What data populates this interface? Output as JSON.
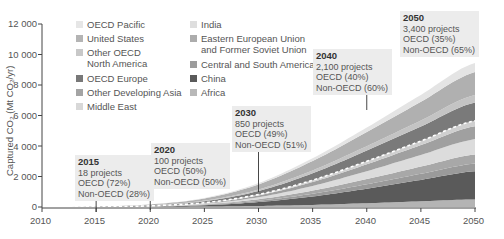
{
  "chart_data": {
    "type": "area",
    "stacked": true,
    "title": "",
    "xlabel": "",
    "ylabel": "Captured CO₂ (Mt CO₂/yr)",
    "xlim": [
      2010,
      2050
    ],
    "ylim": [
      0,
      12000
    ],
    "x_ticks": [
      2010,
      2015,
      2020,
      2025,
      2030,
      2035,
      2040,
      2045,
      2050
    ],
    "y_ticks": [
      0,
      2000,
      4000,
      6000,
      8000,
      10000,
      12000
    ],
    "y_tick_labels": [
      "0",
      "2 000",
      "4 000",
      "6 000",
      "8 000",
      "10 000",
      "12 000"
    ],
    "grid": false,
    "legend_position": "top-left (two columns)",
    "x": [
      2010,
      2015,
      2020,
      2025,
      2030,
      2035,
      2040,
      2045,
      2050
    ],
    "series": [
      {
        "name": "Africa",
        "color": "#b4b4b4",
        "values": [
          0,
          2,
          10,
          30,
          70,
          140,
          250,
          380,
          500
        ]
      },
      {
        "name": "China",
        "color": "#5a5a5a",
        "values": [
          0,
          3,
          20,
          80,
          250,
          550,
          950,
          1400,
          1850
        ]
      },
      {
        "name": "Central and South America",
        "color": "#9a9a9a",
        "values": [
          0,
          2,
          10,
          35,
          90,
          180,
          290,
          400,
          500
        ]
      },
      {
        "name": "Eastern European Union and Former Soviet Union",
        "color": "#a8a8a8",
        "values": [
          0,
          2,
          10,
          35,
          100,
          210,
          340,
          470,
          600
        ]
      },
      {
        "name": "India",
        "color": "#dcdcdc",
        "values": [
          0,
          2,
          10,
          40,
          130,
          300,
          520,
          760,
          1000
        ]
      },
      {
        "name": "Other Developing Asia",
        "color": "#a0a0a0",
        "values": [
          0,
          2,
          10,
          40,
          120,
          260,
          450,
          650,
          850
        ]
      },
      {
        "name": "Middle East",
        "color": "#cfcfcf",
        "values": [
          0,
          1,
          5,
          20,
          60,
          120,
          200,
          270,
          350
        ]
      },
      {
        "name": "OECD Europe",
        "color": "#7a7a7a",
        "values": [
          0,
          5,
          30,
          100,
          230,
          450,
          700,
          950,
          1200
        ]
      },
      {
        "name": "Other OECD North America",
        "color": "#c4c4c4",
        "values": [
          0,
          3,
          15,
          40,
          100,
          190,
          290,
          390,
          500
        ]
      },
      {
        "name": "United States",
        "color": "#b0b0b0",
        "values": [
          0,
          10,
          50,
          140,
          330,
          620,
          920,
          1230,
          1500
        ]
      },
      {
        "name": "OECD Pacific",
        "color": "#e4e4e4",
        "values": [
          0,
          2,
          10,
          30,
          90,
          180,
          300,
          450,
          600
        ]
      }
    ],
    "annotations": [
      {
        "year": "2015",
        "projects": "18 projects",
        "oecd": "OECD (72%)",
        "non_oecd": "Non-OECD (28%)"
      },
      {
        "year": "2020",
        "projects": "100 projects",
        "oecd": "OECD (50%)",
        "non_oecd": "Non-OECD (50%)"
      },
      {
        "year": "2030",
        "projects": "850 projects",
        "oecd": "OECD (49%)",
        "non_oecd": "Non-OECD (51%)"
      },
      {
        "year": "2040",
        "projects": "2,100 projects",
        "oecd": "OECD (40%)",
        "non_oecd": "Non-OECD (60%)"
      },
      {
        "year": "2050",
        "projects": "3,400 projects",
        "oecd": "OECD (35%)",
        "non_oecd": "Non-OECD (65%)"
      }
    ],
    "dashed_line": "OECD / Non-OECD boundary (white dashed)"
  },
  "axis": {
    "ylabel": "Captured CO₂ (Mt CO₂/yr)",
    "y_tick_labels": [
      "12 000",
      "10 000",
      "8 000",
      "6 000",
      "4 000",
      "2 000",
      "0"
    ],
    "x_tick_labels": [
      "2010",
      "2015",
      "2020",
      "2025",
      "2030",
      "2035",
      "2040",
      "2045",
      "2050"
    ]
  },
  "legend": {
    "col1": [
      {
        "label": "OECD Pacific",
        "color": "#e6e6e6"
      },
      {
        "label": "United States",
        "color": "#b4b4b4"
      },
      {
        "label": "Other OECD",
        "label2": "North America",
        "color": "#c8c8c8"
      },
      {
        "label": "OECD Europe",
        "color": "#787878"
      },
      {
        "label": "Other Developing Asia",
        "color": "#a4a4a4"
      },
      {
        "label": "Middle East",
        "color": "#d8d8d8"
      }
    ],
    "col2": [
      {
        "label": "India",
        "color": "#dedede"
      },
      {
        "label": "Eastern European Union",
        "label2": "and Former Soviet Union",
        "color": "#acacac"
      },
      {
        "label": "Central and South America",
        "color": "#9c9c9c"
      },
      {
        "label": "China",
        "color": "#5a5a5a"
      },
      {
        "label": "Africa",
        "color": "#b8b8b8"
      }
    ]
  },
  "annotations": [
    {
      "year": "2015",
      "projects": "18 projects",
      "oecd": "OECD (72%)",
      "non_oecd": "Non-OECD (28%)"
    },
    {
      "year": "2020",
      "projects": "100 projects",
      "oecd": "OECD (50%)",
      "non_oecd": "Non-OECD (50%)"
    },
    {
      "year": "2030",
      "projects": "850 projects",
      "oecd": "OECD (49%)",
      "non_oecd": "Non-OECD (51%)"
    },
    {
      "year": "2040",
      "projects": "2,100 projects",
      "oecd": "OECD (40%)",
      "non_oecd": "Non-OECD (60%)"
    },
    {
      "year": "2050",
      "projects": "3,400 projects",
      "oecd": "OECD (35%)",
      "non_oecd": "Non-OECD (65%)"
    }
  ]
}
